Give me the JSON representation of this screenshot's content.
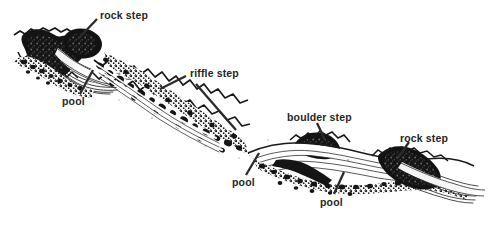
{
  "figure": {
    "kind": "line-drawing",
    "background_color": "#ffffff",
    "ink_color": "#111111",
    "label_color": "#262626",
    "width": 489,
    "height": 226
  },
  "labels": [
    {
      "id": "rock-step-left",
      "text": "rock step",
      "x": 100,
      "y": 10,
      "leader": {
        "x1": 97,
        "y1": 19,
        "x2": 78,
        "y2": 39
      }
    },
    {
      "id": "pool-left",
      "text": "pool",
      "x": 62,
      "y": 96,
      "leader": {
        "x1": 80,
        "y1": 94,
        "x2": 93,
        "y2": 70
      }
    },
    {
      "id": "riffle-step",
      "text": "riffle step",
      "x": 190,
      "y": 68,
      "leader": {
        "x1": 186,
        "y1": 76,
        "x2": 160,
        "y2": 89
      }
    },
    {
      "id": "riffle-step-2",
      "text": "",
      "x": 0,
      "y": 0,
      "leader": {
        "x1": 196,
        "y1": 84,
        "x2": 236,
        "y2": 130
      }
    },
    {
      "id": "pool-mid",
      "text": "pool",
      "x": 232,
      "y": 177,
      "leader": {
        "x1": 246,
        "y1": 175,
        "x2": 259,
        "y2": 153
      }
    },
    {
      "id": "boulder-step",
      "text": "boulder step",
      "x": 287,
      "y": 112,
      "leader": {
        "x1": 317,
        "y1": 123,
        "x2": 325,
        "y2": 140
      }
    },
    {
      "id": "pool-right",
      "text": "pool",
      "x": 320,
      "y": 197,
      "leader": {
        "x1": 334,
        "y1": 194,
        "x2": 344,
        "y2": 172
      }
    },
    {
      "id": "rock-step-right",
      "text": "rock step",
      "x": 400,
      "y": 133,
      "leader": {
        "x1": 409,
        "y1": 142,
        "x2": 398,
        "y2": 158
      }
    }
  ],
  "caption": ""
}
